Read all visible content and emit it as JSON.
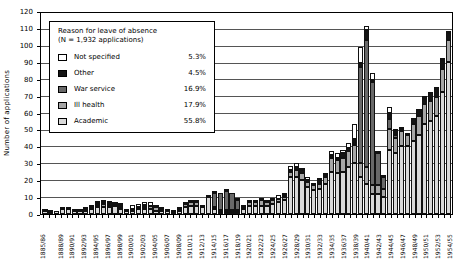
{
  "legend": {
    "title_line1": "Reason for leave of absence",
    "title_line2": "(N = 1,932 applications)",
    "entries": [
      {
        "label": "Not specified",
        "pct": "5.3%",
        "color": "#ffffff"
      },
      {
        "label": "Other",
        "pct": "4.5%",
        "color": "#141414"
      },
      {
        "label": "War service",
        "pct": "16.9%",
        "color": "#696969"
      },
      {
        "label": "Ill health",
        "pct": "17.9%",
        "color": "#a6a6a6"
      },
      {
        "label": "Academic",
        "pct": "55.8%",
        "color": "#d9d9d9"
      }
    ],
    "position": "top-left"
  },
  "y_axis": {
    "title": "Number of applications",
    "min": 0,
    "max": 120,
    "step": 10
  },
  "chart_data": {
    "type": "bar",
    "stacked": true,
    "grid": true,
    "ylim": [
      0,
      120
    ],
    "title": "",
    "xlabel": "",
    "ylabel": "Number of applications",
    "categories": [
      "1885/86",
      "1886/87",
      "1887/88",
      "1888/89",
      "1889/90",
      "1890/91",
      "1891/92",
      "1892/93",
      "1893/94",
      "1894/95",
      "1895/96",
      "1896/97",
      "1897/98",
      "1898/99",
      "1899/00",
      "1900/01",
      "1901/02",
      "1902/03",
      "1903/04",
      "1904/05",
      "1905/06",
      "1906/07",
      "1907/08",
      "1908/09",
      "1909/10",
      "1910/11",
      "1911/12",
      "1912/13",
      "1913/14",
      "1914/15",
      "1915/16",
      "1916/17",
      "1917/18",
      "1918/19",
      "1919/20",
      "1920/21",
      "1921/22",
      "1922/23",
      "1923/24",
      "1924/25",
      "1925/26",
      "1926/27",
      "1927/28",
      "1928/29",
      "1929/30",
      "1930/31",
      "1931/32",
      "1932/33",
      "1933/34",
      "1934/35",
      "1935/36",
      "1936/37",
      "1937/38",
      "1938/39",
      "1939/40",
      "1940/41",
      "1941/42",
      "1942/43",
      "1943/44",
      "1944/45",
      "1945/46",
      "1946/47",
      "1947/48",
      "1948/49",
      "1949/50",
      "1950/51",
      "1951/52",
      "1952/53",
      "1953/54",
      "1954/55"
    ],
    "x_tick_labels": [
      "1885/86",
      "1888/89",
      "1890/91",
      "1892/93",
      "1894/95",
      "1896/97",
      "1898/99",
      "1900/01",
      "1902/03",
      "1904/05",
      "1906/07",
      "1908/09",
      "1910/11",
      "1912/13",
      "1914/15",
      "1916/17",
      "1918/19",
      "1920/21",
      "1922/23",
      "1924/25",
      "1926/27",
      "1928/29",
      "1930/31",
      "1932/33",
      "1934/35",
      "1936/37",
      "1938/39",
      "1940/41",
      "1942/43",
      "1944/45",
      "1946/47",
      "1948/49",
      "1950/51",
      "1952/53",
      "1954/55"
    ],
    "series": [
      {
        "name": "Academic",
        "color": "#d9d9d9",
        "values": [
          2,
          1,
          2,
          3,
          3,
          2,
          2,
          2,
          3,
          4,
          4,
          4,
          5,
          3,
          2,
          2,
          3,
          3,
          3,
          2,
          2,
          2,
          1,
          2,
          4,
          5,
          5,
          4,
          10,
          3,
          1,
          1,
          1,
          1,
          3,
          5,
          5,
          5,
          5,
          6,
          7,
          8,
          22,
          22,
          20,
          16,
          14,
          15,
          18,
          25,
          24,
          25,
          28,
          30,
          22,
          18,
          12,
          12,
          10,
          38,
          36,
          40,
          40,
          43,
          47,
          53,
          55,
          58,
          72,
          90
        ]
      },
      {
        "name": "Ill health",
        "color": "#a6a6a6",
        "values": [
          0,
          0,
          0,
          0,
          1,
          0,
          0,
          1,
          1,
          1,
          2,
          1,
          1,
          1,
          0,
          1,
          1,
          1,
          2,
          2,
          1,
          1,
          1,
          1,
          2,
          2,
          2,
          0,
          0,
          1,
          1,
          1,
          1,
          1,
          1,
          2,
          2,
          3,
          2,
          2,
          2,
          2,
          3,
          4,
          4,
          3,
          3,
          3,
          4,
          8,
          8,
          8,
          9,
          11,
          8,
          10,
          5,
          5,
          5,
          12,
          9,
          9,
          7,
          10,
          11,
          12,
          12,
          11,
          14,
          13
        ]
      },
      {
        "name": "War service",
        "color": "#696969",
        "values": [
          0,
          0,
          0,
          0,
          0,
          0,
          0,
          0,
          0,
          0,
          0,
          0,
          0,
          0,
          0,
          0,
          0,
          0,
          0,
          0,
          0,
          0,
          0,
          0,
          0,
          0,
          0,
          0,
          0,
          8,
          10,
          11,
          10,
          6,
          1,
          0,
          0,
          0,
          0,
          0,
          0,
          0,
          0,
          0,
          0,
          0,
          0,
          0,
          0,
          0,
          0,
          0,
          0,
          1,
          57,
          75,
          61,
          19,
          7,
          6,
          2,
          0,
          0,
          0,
          0,
          0,
          0,
          0,
          0,
          0
        ]
      },
      {
        "name": "Other",
        "color": "#141414",
        "values": [
          0,
          1,
          0,
          0,
          0,
          0,
          1,
          1,
          0,
          1,
          1,
          1,
          0,
          1,
          0,
          0,
          0,
          1,
          0,
          0,
          0,
          0,
          0,
          0,
          0,
          0,
          1,
          0,
          0,
          0,
          0,
          0,
          0,
          0,
          0,
          0,
          0,
          0,
          0,
          0,
          0,
          1,
          1,
          2,
          2,
          1,
          0,
          2,
          1,
          2,
          1,
          3,
          2,
          2,
          2,
          6,
          1,
          1,
          1,
          4,
          3,
          1,
          1,
          4,
          4,
          5,
          5,
          6,
          5,
          4
        ]
      },
      {
        "name": "Not specified",
        "color": "#ffffff",
        "values": [
          1,
          0,
          0,
          1,
          0,
          1,
          0,
          0,
          1,
          1,
          1,
          1,
          1,
          1,
          1,
          2,
          2,
          2,
          2,
          1,
          1,
          0,
          0,
          1,
          1,
          1,
          0,
          1,
          1,
          1,
          0,
          1,
          0,
          1,
          0,
          1,
          1,
          1,
          1,
          1,
          2,
          1,
          2,
          2,
          1,
          2,
          1,
          1,
          1,
          2,
          3,
          2,
          3,
          9,
          10,
          2,
          4,
          0,
          0,
          3,
          0,
          1,
          0,
          0,
          0,
          0,
          0,
          0,
          1,
          1
        ]
      }
    ]
  }
}
